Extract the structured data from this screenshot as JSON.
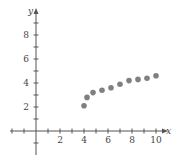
{
  "chart_data": {
    "type": "scatter",
    "title": "",
    "xlabel": "x",
    "ylabel": "y",
    "xlim": [
      -2,
      11
    ],
    "ylim": [
      -2,
      10
    ],
    "x_ticks": [
      -2,
      -1,
      1,
      2,
      3,
      4,
      5,
      6,
      7,
      8,
      9,
      10
    ],
    "x_tick_labels": [
      "2",
      "4",
      "6",
      "8",
      "10"
    ],
    "x_tick_label_values": [
      2,
      4,
      6,
      8,
      10
    ],
    "y_ticks": [
      -1,
      1,
      2,
      3,
      4,
      5,
      6,
      7,
      8,
      9
    ],
    "y_tick_labels": [
      "2",
      "4",
      "6",
      "8"
    ],
    "y_tick_label_values": [
      2,
      4,
      6,
      8
    ],
    "grid": false,
    "legend": null,
    "point_color": "#808080",
    "x": [
      4,
      4.25,
      4.75,
      5.5,
      6.25,
      7,
      7.75,
      8.5,
      9.25,
      10
    ],
    "y": [
      2.1,
      2.8,
      3.2,
      3.4,
      3.6,
      3.9,
      4.2,
      4.3,
      4.4,
      4.6
    ]
  }
}
